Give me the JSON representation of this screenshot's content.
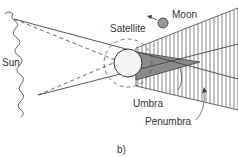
{
  "diagram": {
    "type": "eclipse-shadow-diagram",
    "panel_label": "b)",
    "labels": {
      "sun": "Sun",
      "moon": "Moon",
      "satellite": "Satellite",
      "umbra": "Umbra",
      "penumbra": "Penumbra"
    },
    "colors": {
      "line": "#444444",
      "umbra_fill": "#8a8a8a",
      "hatch": "#555555",
      "background": "#ffffff"
    }
  }
}
